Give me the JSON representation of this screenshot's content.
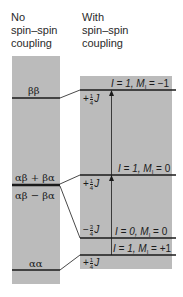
{
  "headers": {
    "left": [
      "No",
      "spin–spin",
      "coupling"
    ],
    "right": [
      "With",
      "spin–spin",
      "coupling"
    ]
  },
  "left_levels": [
    {
      "label": "ββ"
    },
    {
      "label_above": "αβ + βα",
      "label_below": "αβ − βα"
    },
    {
      "label": "αα"
    }
  ],
  "right_levels": [
    {
      "I": "1",
      "Mi": "−1",
      "text_I": "I = 1, ",
      "text_M": "M",
      "text_sub": "I",
      "text_val": " = −1"
    },
    {
      "I": "1",
      "Mi": "0",
      "text_I": "I = 1, ",
      "text_M": "M",
      "text_sub": "I",
      "text_val": " = 0"
    },
    {
      "I": "0",
      "Mi": "0",
      "text_I": "I = 0, ",
      "text_M": "M",
      "text_sub": "I",
      "text_val": " = 0"
    },
    {
      "I": "1",
      "Mi": "+1",
      "text_I": "I = 1, ",
      "text_M": "M",
      "text_sub": "I",
      "text_val": " = +1"
    }
  ],
  "shifts": [
    {
      "sign": "+",
      "num": "1",
      "den": "4",
      "sym": "J"
    },
    {
      "sign": "+",
      "num": "1",
      "den": "4",
      "sym": "J"
    },
    {
      "sign": "−",
      "num": "3",
      "den": "4",
      "sym": "J"
    },
    {
      "sign": "+",
      "num": "1",
      "den": "4",
      "sym": "J"
    }
  ],
  "colors": {
    "fill": "#bbbbbb",
    "line": "#1a1a1a"
  }
}
